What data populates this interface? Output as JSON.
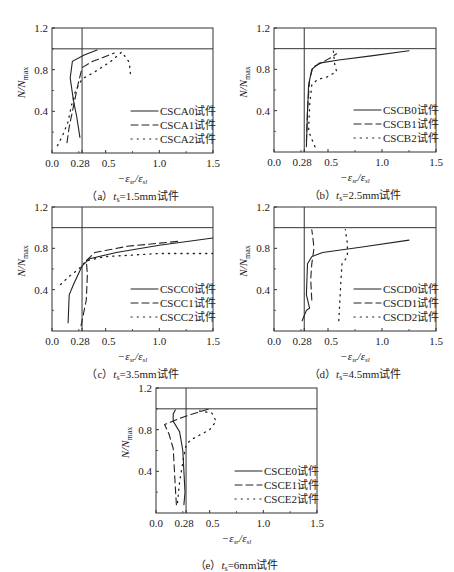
{
  "figure": {
    "y_axis_label": "N/N",
    "y_axis_label_sub": "max",
    "x_axis_label": "−ε",
    "x_axis_label_sub1": "sr",
    "x_axis_label_mid": "/ε",
    "x_axis_label_sub2": "sl",
    "x_ticks": [
      "0.0",
      "0.28",
      "0.5",
      "1.0",
      "1.5"
    ],
    "y_ticks": [
      "0.4",
      "0.8",
      "1.2"
    ]
  },
  "chart_data": [
    {
      "type": "line",
      "id": "a",
      "title": "（a）t_s=1.5mm试件",
      "caption_prefix": "（a）",
      "caption_t": "t",
      "caption_sub": "s",
      "caption_suffix": "=1.5mm试件",
      "xlabel": "−ε_sr/ε_sl",
      "ylabel": "N/N_max",
      "xlim": [
        0,
        1.5
      ],
      "ylim": [
        0,
        1.2
      ],
      "xticks": [
        0.0,
        0.28,
        0.5,
        1.0,
        1.5
      ],
      "yticks": [
        0.4,
        0.8,
        1.2
      ],
      "reference_lines": {
        "vertical_x": 0.28,
        "horizontal_y": 1.0
      },
      "legend_position": "lower right",
      "series": [
        {
          "name": "CSCA0试件",
          "style": "solid",
          "points": [
            [
              0.26,
              0.15
            ],
            [
              0.23,
              0.35
            ],
            [
              0.2,
              0.5
            ],
            [
              0.17,
              0.72
            ],
            [
              0.19,
              0.88
            ],
            [
              0.3,
              0.94
            ],
            [
              0.42,
              0.99
            ]
          ]
        },
        {
          "name": "CSCA1试件",
          "style": "dashed",
          "points": [
            [
              0.14,
              0.1
            ],
            [
              0.16,
              0.25
            ],
            [
              0.2,
              0.45
            ],
            [
              0.24,
              0.65
            ],
            [
              0.28,
              0.82
            ],
            [
              0.38,
              0.88
            ],
            [
              0.48,
              0.92
            ],
            [
              0.58,
              0.96
            ]
          ]
        },
        {
          "name": "CSCA2试件",
          "style": "dotted",
          "points": [
            [
              0.05,
              0.07
            ],
            [
              0.1,
              0.17
            ],
            [
              0.15,
              0.3
            ],
            [
              0.18,
              0.45
            ],
            [
              0.22,
              0.6
            ],
            [
              0.28,
              0.71
            ],
            [
              0.4,
              0.78
            ],
            [
              0.55,
              0.88
            ],
            [
              0.65,
              0.97
            ],
            [
              0.72,
              0.87
            ],
            [
              0.73,
              0.76
            ]
          ]
        }
      ]
    },
    {
      "type": "line",
      "id": "b",
      "title": "（b）t_s=2.5mm试件",
      "caption_prefix": "（b）",
      "caption_t": "t",
      "caption_sub": "s",
      "caption_suffix": "=2.5mm试件",
      "xlabel": "−ε_sr/ε_sl",
      "ylabel": "N/N_max",
      "xlim": [
        0,
        1.5
      ],
      "ylim": [
        0,
        1.2
      ],
      "xticks": [
        0.0,
        0.28,
        0.5,
        1.0,
        1.5
      ],
      "yticks": [
        0.4,
        0.8,
        1.2
      ],
      "reference_lines": {
        "vertical_x": 0.28,
        "horizontal_y": 1.0
      },
      "legend_position": "lower right",
      "series": [
        {
          "name": "CSCB0试件",
          "style": "solid",
          "points": [
            [
              0.3,
              0.05
            ],
            [
              0.31,
              0.4
            ],
            [
              0.32,
              0.65
            ],
            [
              0.35,
              0.8
            ],
            [
              0.42,
              0.86
            ],
            [
              0.6,
              0.89
            ],
            [
              0.9,
              0.93
            ],
            [
              1.25,
              0.98
            ]
          ]
        },
        {
          "name": "CSCB1试件",
          "style": "dashed",
          "points": [
            [
              0.3,
              0.1
            ],
            [
              0.31,
              0.4
            ],
            [
              0.33,
              0.7
            ],
            [
              0.36,
              0.82
            ],
            [
              0.45,
              0.87
            ],
            [
              0.52,
              0.91
            ],
            [
              0.58,
              0.95
            ]
          ]
        },
        {
          "name": "CSCB2试件",
          "style": "dotted",
          "points": [
            [
              0.38,
              0.05
            ],
            [
              0.32,
              0.2
            ],
            [
              0.33,
              0.45
            ],
            [
              0.35,
              0.65
            ],
            [
              0.4,
              0.7
            ],
            [
              0.5,
              0.73
            ],
            [
              0.58,
              0.78
            ],
            [
              0.56,
              0.86
            ],
            [
              0.55,
              0.98
            ]
          ]
        }
      ]
    },
    {
      "type": "line",
      "id": "c",
      "title": "（c）t_s=3.5mm试件",
      "caption_prefix": "（c）",
      "caption_t": "t",
      "caption_sub": "s",
      "caption_suffix": "=3.5mm试件",
      "xlabel": "−ε_sr/ε_sl",
      "ylabel": "N/N_max",
      "xlim": [
        0,
        1.5
      ],
      "ylim": [
        0,
        1.2
      ],
      "xticks": [
        0.0,
        0.28,
        0.5,
        1.0,
        1.5
      ],
      "yticks": [
        0.4,
        0.8,
        1.2
      ],
      "reference_lines": {
        "vertical_x": 0.28,
        "horizontal_y": 1.0
      },
      "legend_position": "lower right",
      "series": [
        {
          "name": "CSCC0试件",
          "style": "solid",
          "points": [
            [
              0.15,
              0.08
            ],
            [
              0.16,
              0.35
            ],
            [
              0.2,
              0.45
            ],
            [
              0.28,
              0.63
            ],
            [
              0.35,
              0.7
            ],
            [
              0.6,
              0.76
            ],
            [
              1.0,
              0.83
            ],
            [
              1.5,
              0.9
            ]
          ]
        },
        {
          "name": "CSCC1试件",
          "style": "dashed",
          "points": [
            [
              0.27,
              0.05
            ],
            [
              0.32,
              0.3
            ],
            [
              0.33,
              0.55
            ],
            [
              0.32,
              0.68
            ],
            [
              0.4,
              0.76
            ],
            [
              0.7,
              0.82
            ],
            [
              1.2,
              0.87
            ]
          ]
        },
        {
          "name": "CSCC2试件",
          "style": "dotted",
          "points": [
            [
              0.08,
              0.45
            ],
            [
              0.15,
              0.52
            ],
            [
              0.25,
              0.6
            ],
            [
              0.32,
              0.68
            ],
            [
              0.5,
              0.72
            ],
            [
              1.0,
              0.75
            ],
            [
              1.5,
              0.75
            ]
          ]
        }
      ]
    },
    {
      "type": "line",
      "id": "d",
      "title": "（d）t_s=4.5mm试件",
      "caption_prefix": "（d）",
      "caption_t": "t",
      "caption_sub": "s",
      "caption_suffix": "=4.5mm试件",
      "xlabel": "−ε_sr/ε_sl",
      "ylabel": "N/N_max",
      "xlim": [
        0,
        1.5
      ],
      "ylim": [
        0,
        1.2
      ],
      "xticks": [
        0.0,
        0.28,
        0.5,
        1.0,
        1.5
      ],
      "yticks": [
        0.4,
        0.8,
        1.2
      ],
      "reference_lines": {
        "vertical_x": 0.28,
        "horizontal_y": 1.0
      },
      "legend_position": "lower right",
      "series": [
        {
          "name": "CSCD0试件",
          "style": "solid",
          "points": [
            [
              0.26,
              0.1
            ],
            [
              0.3,
              0.2
            ],
            [
              0.33,
              0.22
            ],
            [
              0.3,
              0.35
            ],
            [
              0.31,
              0.65
            ],
            [
              0.35,
              0.72
            ],
            [
              0.45,
              0.76
            ],
            [
              0.8,
              0.81
            ],
            [
              1.25,
              0.88
            ]
          ]
        },
        {
          "name": "CSCD1试件",
          "style": "dashed",
          "points": [
            [
              0.35,
              0.3
            ],
            [
              0.34,
              0.5
            ],
            [
              0.35,
              0.65
            ],
            [
              0.37,
              0.8
            ],
            [
              0.36,
              0.9
            ],
            [
              0.35,
              0.98
            ]
          ]
        },
        {
          "name": "CSCD2试件",
          "style": "dotted",
          "points": [
            [
              0.6,
              0.1
            ],
            [
              0.61,
              0.3
            ],
            [
              0.62,
              0.5
            ],
            [
              0.63,
              0.65
            ],
            [
              0.68,
              0.72
            ],
            [
              0.68,
              0.85
            ],
            [
              0.66,
              0.98
            ]
          ]
        }
      ]
    },
    {
      "type": "line",
      "id": "e",
      "title": "（e）t_s=6mm试件",
      "caption_prefix": "（e）",
      "caption_t": "t",
      "caption_sub": "s",
      "caption_suffix": "=6mm试件",
      "xlabel": "−ε_sr/ε_sl",
      "ylabel": "N/N_max",
      "xlim": [
        0,
        1.5
      ],
      "ylim": [
        0,
        1.2
      ],
      "xticks": [
        0.0,
        0.28,
        0.5,
        1.0,
        1.5
      ],
      "yticks": [
        0.4,
        0.8,
        1.2
      ],
      "reference_lines": {
        "vertical_x": 0.28,
        "horizontal_y": 1.0
      },
      "legend_position": "lower right",
      "series": [
        {
          "name": "CSCE0试件",
          "style": "solid",
          "points": [
            [
              0.26,
              0.08
            ],
            [
              0.27,
              0.2
            ],
            [
              0.26,
              0.4
            ],
            [
              0.25,
              0.6
            ],
            [
              0.22,
              0.78
            ],
            [
              0.16,
              0.88
            ],
            [
              0.16,
              0.95
            ],
            [
              0.18,
              0.99
            ]
          ]
        },
        {
          "name": "CSCE1试件",
          "style": "dashed",
          "points": [
            [
              0.19,
              0.08
            ],
            [
              0.18,
              0.25
            ],
            [
              0.17,
              0.45
            ],
            [
              0.16,
              0.62
            ],
            [
              0.12,
              0.76
            ],
            [
              0.08,
              0.85
            ],
            [
              0.25,
              0.92
            ],
            [
              0.4,
              0.97
            ],
            [
              0.5,
              1.0
            ]
          ]
        },
        {
          "name": "CSCE2试件",
          "style": "dotted",
          "points": [
            [
              0.2,
              0.1
            ],
            [
              0.22,
              0.3
            ],
            [
              0.26,
              0.55
            ],
            [
              0.28,
              0.65
            ],
            [
              0.32,
              0.7
            ],
            [
              0.5,
              0.8
            ],
            [
              0.56,
              0.88
            ],
            [
              0.52,
              0.96
            ],
            [
              0.4,
              0.98
            ]
          ]
        }
      ]
    }
  ]
}
